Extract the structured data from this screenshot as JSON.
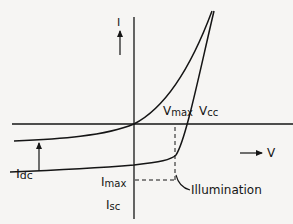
{
  "diagram": {
    "axes": {
      "current_label": "I",
      "voltage_label": "V"
    },
    "labels": {
      "vmax": "V",
      "vmax_sub": "max",
      "voc": "V",
      "voc_sub": "cc",
      "idc": "I",
      "idc_sub": "dc",
      "imax": "I",
      "imax_sub": "max",
      "isc": "I",
      "isc_sub": "sc",
      "illumination": "Illumination"
    },
    "curves": [
      {
        "name": "dark-curve",
        "description": "diode curve without illumination, passes through origin"
      },
      {
        "name": "illuminated-curve",
        "description": "curve shifted down by photocurrent Idc"
      }
    ],
    "colors": {
      "ink": "#151515",
      "paper": "#f6f5f3"
    }
  }
}
